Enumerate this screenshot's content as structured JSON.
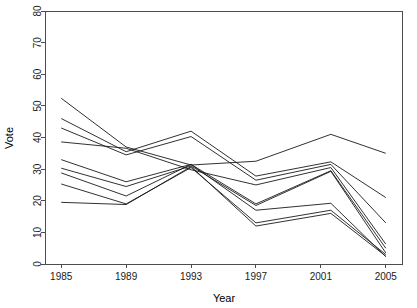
{
  "chart_data": {
    "type": "line",
    "title": "",
    "subtitle": "",
    "xlabel": "Year",
    "ylabel": "Vote",
    "x": [
      1985,
      1989,
      1993,
      1997,
      2001,
      2005
    ],
    "xlim": [
      1984,
      2006
    ],
    "ylim": [
      0,
      80
    ],
    "xticks": [
      1985,
      1989,
      1993,
      1997,
      2001,
      2005
    ],
    "xtick_labels": [
      "1985",
      "1989",
      "1993",
      "1997",
      "2001",
      "2005"
    ],
    "yticks": [
      0,
      10,
      20,
      30,
      40,
      50,
      60,
      70,
      80
    ],
    "ytick_labels": [
      "0",
      "10",
      "20",
      "30",
      "40",
      "50",
      "60",
      "70",
      "80"
    ],
    "grid": false,
    "legend": null,
    "legend_position": "none",
    "note_x_offset": "2001 series vertices are drawn slightly right of the 2001 tick",
    "series": [
      {
        "name": "series-1",
        "values": [
          52.4,
          37.0,
          31.3,
          32.5,
          41.0,
          35.0
        ]
      },
      {
        "name": "series-2",
        "values": [
          46.0,
          35.5,
          42.0,
          27.8,
          32.3,
          21.0
        ]
      },
      {
        "name": "series-3",
        "values": [
          43.0,
          34.5,
          40.3,
          26.5,
          31.5,
          13.0
        ]
      },
      {
        "name": "series-4",
        "values": [
          38.6,
          36.6,
          29.8,
          25.0,
          30.5,
          6.3
        ]
      },
      {
        "name": "series-5",
        "values": [
          33.0,
          26.0,
          31.5,
          19.0,
          29.5,
          5.0
        ]
      },
      {
        "name": "series-6",
        "values": [
          30.3,
          24.5,
          31.0,
          18.5,
          29.3,
          3.5
        ]
      },
      {
        "name": "series-7",
        "values": [
          28.8,
          21.5,
          31.5,
          17.0,
          19.2,
          2.3
        ]
      },
      {
        "name": "series-8",
        "values": [
          25.3,
          19.0,
          30.5,
          13.0,
          17.0,
          3.0
        ]
      },
      {
        "name": "series-9",
        "values": [
          19.5,
          18.8,
          30.8,
          12.0,
          16.0,
          2.5
        ]
      }
    ]
  },
  "axes": {
    "x_title": "Year",
    "y_title": "Vote"
  }
}
